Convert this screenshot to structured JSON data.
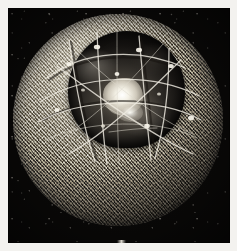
{
  "figure": {
    "kind": "photograph",
    "medium": "grayscale-photograph",
    "caption": ""
  },
  "plate": {
    "background_color": "#f3f2ef",
    "photo_background_color": "#090807",
    "margin_px": 8
  },
  "sphere": {
    "label": "mesh-reflector-sphere",
    "center_x": 118,
    "center_y": 124,
    "radius": 105,
    "mesh_highlight_color": "#b9b4a8",
    "mesh_shadow_color": "#262421",
    "weave_light_color": "#eeece4",
    "weave_dark_color": "#1e1c19"
  },
  "cavity": {
    "label": "recessed-reflector-cavity",
    "fill_color": "#2b2824",
    "deep_color": "#0a0908",
    "specular_color": "#ffffff"
  },
  "ribs": {
    "label": "wire-rib-struts",
    "stroke_color": "#efece2",
    "node_color": "#f7f4ea",
    "count": 11
  }
}
